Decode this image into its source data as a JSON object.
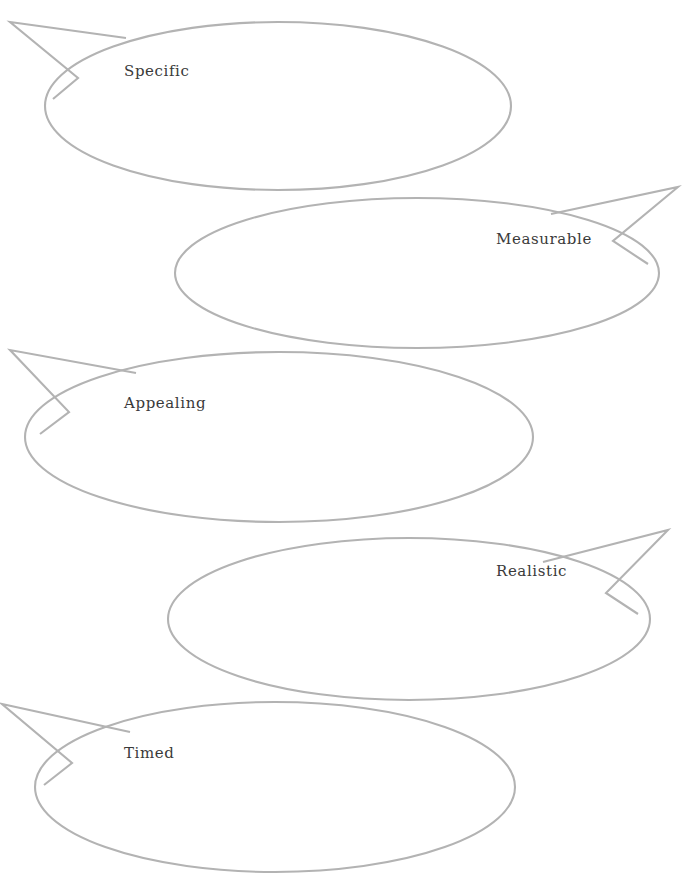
{
  "diagram": {
    "type": "speech-bubble-list",
    "background_color": "#ffffff",
    "outline_color": "#b3b3b3",
    "text_color": "#3a3a3a",
    "stroke_width": 2.1,
    "bubbles": [
      {
        "id": "specific",
        "label": "Specific",
        "tail_direction": "upper-left",
        "label_x": 124,
        "label_y": 64,
        "ellipse": {
          "cx": 278,
          "cy": 106,
          "rx": 233,
          "ry": 84
        },
        "tail": "M 126,38 L 10,22 L 78,78 L 53,99"
      },
      {
        "id": "measurable",
        "label": "Measurable",
        "tail_direction": "upper-right",
        "label_x": 496,
        "label_y": 232,
        "ellipse": {
          "cx": 417,
          "cy": 273,
          "rx": 242,
          "ry": 75
        },
        "tail": "M 551,214 L 678,187 L 613,241 L 648,264"
      },
      {
        "id": "appealing",
        "label": "Appealing",
        "tail_direction": "upper-left",
        "label_x": 124,
        "label_y": 396,
        "ellipse": {
          "cx": 279,
          "cy": 437,
          "rx": 254,
          "ry": 85
        },
        "tail": "M 136,373 L 10,350 L 69,412 L 40,434"
      },
      {
        "id": "realistic",
        "label": "Realistic",
        "tail_direction": "upper-right",
        "label_x": 496,
        "label_y": 564,
        "ellipse": {
          "cx": 409,
          "cy": 619,
          "rx": 241,
          "ry": 81
        },
        "tail": "M 543,562 L 668,530 L 606,593 L 638,614"
      },
      {
        "id": "timed",
        "label": "Timed",
        "tail_direction": "upper-left",
        "label_x": 124,
        "label_y": 746,
        "ellipse": {
          "cx": 275,
          "cy": 787,
          "rx": 240,
          "ry": 85
        },
        "tail": "M 130,732 L 2,704 L 72,763 L 44,785"
      }
    ]
  }
}
